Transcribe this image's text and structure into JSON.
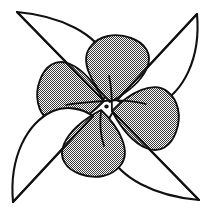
{
  "figure": {
    "kind": "line-drawing",
    "canvas": {
      "width": 211,
      "height": 215,
      "background": "#ffffff"
    },
    "style": {
      "outline_color": "#111111",
      "outline_width": 2.1,
      "inner_outline_width": 1.9,
      "fill_outer": "#ffffff",
      "fill_inner_pattern": "stipple-checker",
      "fill_inner_dot_color": "#3a3a3a",
      "pin_color": "#101010"
    },
    "symmetry": {
      "type": "rotational",
      "order": 4,
      "angle_step_deg": 90,
      "center": {
        "x": 105.5,
        "y": 105.0
      }
    },
    "center_pin": {
      "x": 106.5,
      "y": 106.5,
      "rx": 2.2,
      "ry": 1.9,
      "label": "center-pin"
    },
    "blades": [
      {
        "name": "blade-top-left",
        "rotation_deg": 0,
        "tip": {
          "x": 17,
          "y": 12
        },
        "outer_path": "M 17 12 C 62 16 96 34 108 60 C 114 74 110 90 103 100 L 17 12 Z",
        "inner_path": "M 104 101 C 96 86 84 70 70 64 C 56 58 45 66 40 80 C 34 96 38 112 48 120 C 62 132 86 120 104 101 Z"
      },
      {
        "name": "blade-top-right",
        "rotation_deg": 90,
        "tip": {
          "x": 197,
          "y": 14
        },
        "outer_path": "M 197 14 C 201 59 183 93 157 105 C 143 111 127 107 117 100 L 197 14 Z",
        "inner_path": "M 110 102 C 125 94 141 82 147 68 C 153 54 145 43 131 38 C 115 32 99 36 91 46 C 79 60 91 84 110 102 Z"
      },
      {
        "name": "blade-bottom-right",
        "rotation_deg": 180,
        "tip": {
          "x": 199,
          "y": 200
        },
        "outer_path": "M 199 200 C 154 196 120 178 108 152 C 102 138 106 122 113 112 L 199 200 Z",
        "inner_path": "M 112 111 C 120 126 132 142 146 148 C 160 154 171 146 176 132 C 182 116 178 100 168 92 C 154 80 130 92 112 111 Z"
      },
      {
        "name": "blade-bottom-left",
        "rotation_deg": 270,
        "tip": {
          "x": 13,
          "y": 202
        },
        "outer_path": "M 13 202 C 9 157 27 123 53 111 C 67 105 83 109 93 116 L 13 202 Z",
        "inner_path": "M 101 110 C 86 118 70 130 64 144 C 58 158 66 169 80 174 C 96 180 112 176 120 166 C 132 152 120 128 101 110 Z"
      }
    ],
    "spokes": [
      {
        "name": "spoke-top-left",
        "from": {
          "x": 17,
          "y": 12
        },
        "to": {
          "x": 103,
          "y": 100
        }
      },
      {
        "name": "spoke-top-right",
        "from": {
          "x": 197,
          "y": 14
        },
        "to": {
          "x": 117,
          "y": 100
        }
      },
      {
        "name": "spoke-bottom-right",
        "from": {
          "x": 199,
          "y": 200
        },
        "to": {
          "x": 113,
          "y": 112
        }
      },
      {
        "name": "spoke-bottom-left",
        "from": {
          "x": 13,
          "y": 202
        },
        "to": {
          "x": 93,
          "y": 116
        }
      }
    ]
  }
}
